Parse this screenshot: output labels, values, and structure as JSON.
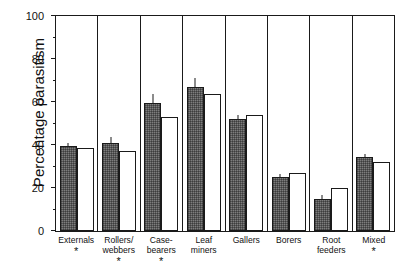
{
  "chart_data": {
    "type": "bar",
    "title": "",
    "xlabel": "",
    "ylabel": "Percentage parasitism",
    "ylim": [
      0,
      100
    ],
    "yticks": [
      0,
      20,
      40,
      60,
      80,
      100
    ],
    "ytick_labels": [
      "0",
      "20",
      "40",
      "60",
      "80",
      "100"
    ],
    "minor_yticks": [
      10,
      30,
      50,
      70,
      90
    ],
    "grid": false,
    "legend": null,
    "categories": [
      "Externals",
      "Rollers/ webbers",
      "Case- bearers",
      "Leaf miners",
      "Gallers",
      "Borers",
      "Root feeders",
      "Mixed"
    ],
    "category_lines": [
      [
        "Externals"
      ],
      [
        "Rollers/",
        "webbers"
      ],
      [
        "Case-",
        "bearers"
      ],
      [
        "Leaf",
        "miners"
      ],
      [
        "Gallers"
      ],
      [
        "Borers"
      ],
      [
        "Root",
        "feeders"
      ],
      [
        "Mixed"
      ]
    ],
    "significance_marks": [
      "*",
      "*",
      "*",
      "",
      "",
      "",
      "",
      "*"
    ],
    "series": [
      {
        "name": "shaded",
        "fill": "hatched-grey",
        "values": [
          39.5,
          40.8,
          59.5,
          66.8,
          52.3,
          25.0,
          15.0,
          34.2
        ],
        "errors": [
          1.8,
          3.3,
          4.6,
          4.8,
          2.0,
          1.8,
          2.3,
          1.9
        ]
      },
      {
        "name": "open",
        "fill": "white",
        "values": [
          38.6,
          37.3,
          52.8,
          63.5,
          53.9,
          26.8,
          19.8,
          32.3
        ],
        "errors": [
          0,
          0,
          0,
          0,
          0,
          0,
          0,
          0
        ]
      }
    ]
  },
  "colors": {
    "axis": "#1a1a1a",
    "shaded_bar": "#7d7d7d",
    "open_bar": "#ffffff",
    "background": "#ffffff"
  }
}
